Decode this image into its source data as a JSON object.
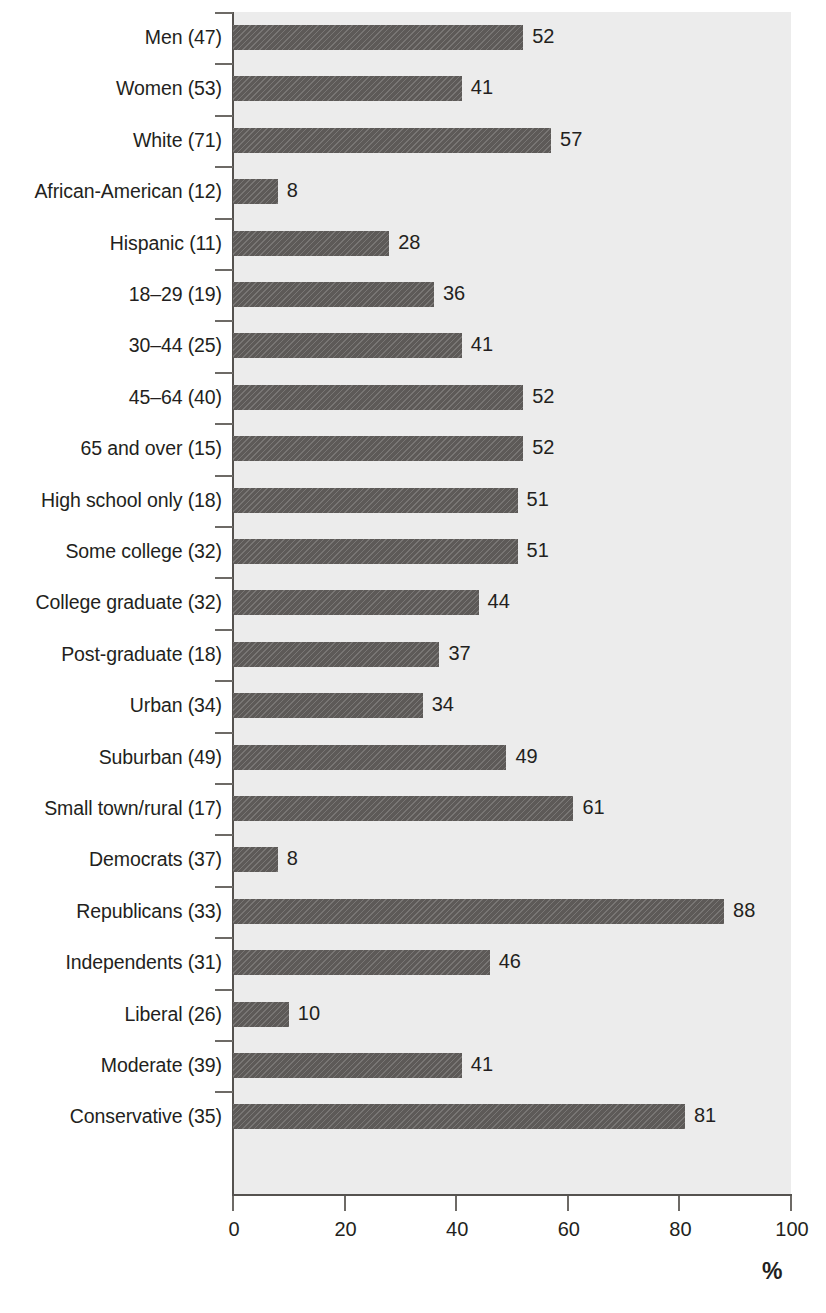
{
  "chart_data": {
    "type": "bar",
    "orientation": "horizontal",
    "title": "",
    "xlabel": "%",
    "ylabel": "",
    "xlim": [
      0,
      100
    ],
    "xticks": [
      0,
      20,
      40,
      60,
      80,
      100
    ],
    "xtick_labels": [
      "0",
      "20",
      "40",
      "60",
      "80",
      "100"
    ],
    "grid": false,
    "legend": false,
    "bar_color": "#5d5a58",
    "plot_background": "#ececec",
    "categories": [
      "Men (47)",
      "Women (53)",
      "White (71)",
      "African-American (12)",
      "Hispanic (11)",
      "18–29 (19)",
      "30–44 (25)",
      "45–64 (40)",
      "65 and over (15)",
      "High school only (18)",
      "Some college (32)",
      "College graduate (32)",
      "Post-graduate (18)",
      "Urban (34)",
      "Suburban (49)",
      "Small town/rural (17)",
      "Democrats (37)",
      "Republicans (33)",
      "Independents (31)",
      "Liberal (26)",
      "Moderate (39)",
      "Conservative (35)"
    ],
    "values": [
      52,
      41,
      57,
      8,
      28,
      36,
      41,
      52,
      52,
      51,
      51,
      44,
      37,
      34,
      49,
      61,
      8,
      88,
      46,
      10,
      41,
      81
    ],
    "value_labels": [
      "52",
      "41",
      "57",
      "8",
      "28",
      "36",
      "41",
      "52",
      "52",
      "51",
      "51",
      "44",
      "37",
      "34",
      "49",
      "61",
      "8",
      "88",
      "46",
      "10",
      "41",
      "81"
    ]
  },
  "axis": {
    "unit_label": "%"
  }
}
